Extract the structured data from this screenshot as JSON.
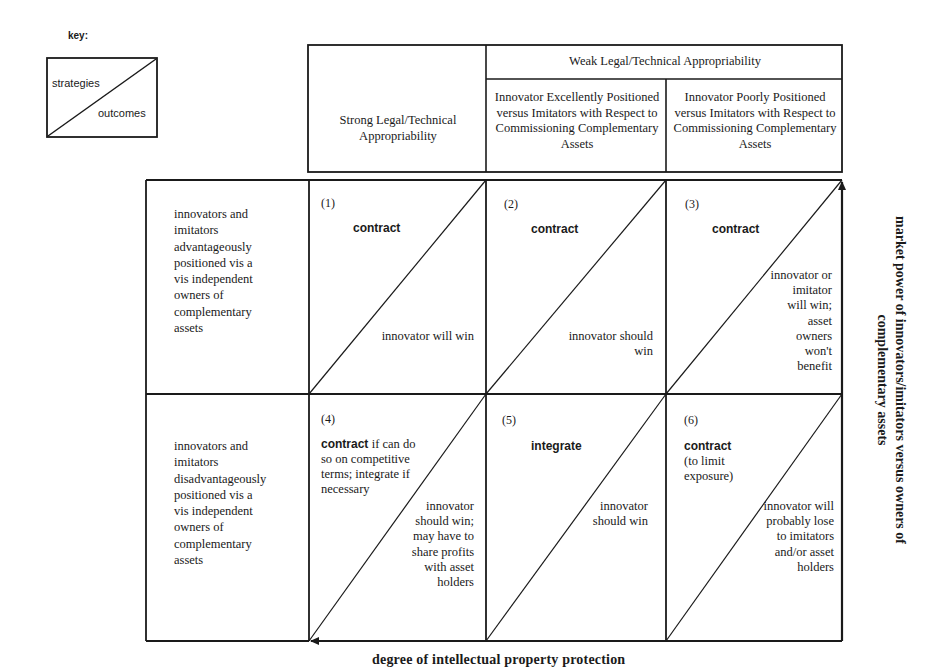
{
  "key": {
    "title": "key:",
    "upper": "strategies",
    "lower": "outcomes"
  },
  "columns": {
    "strong": "Strong Legal/Technical Appropriability",
    "weak": "Weak Legal/Technical Appropriability",
    "weak_excellent": "Innovator Excellently Positioned versus Imitators with Respect to Commissioning Complementary Assets",
    "weak_poor": "Innovator Poorly Positioned versus Imitators with Respect to Commissioning Complementary Assets"
  },
  "rows": {
    "advantaged": "innovators and imitators advantageously positioned vis a vis independent owners of complementary assets",
    "disadvantaged": "innovators and imitators disadvantageously positioned vis a vis independent owners of complementary assets"
  },
  "cells": [
    {
      "number": "(1)",
      "strategy": "contract",
      "strategy_rest": "",
      "outcome": "innovator will win"
    },
    {
      "number": "(2)",
      "strategy": "contract",
      "strategy_rest": "",
      "outcome": "innovator should win"
    },
    {
      "number": "(3)",
      "strategy": "contract",
      "strategy_rest": "",
      "outcome": "innovator or imitator will win; asset owners won't benefit"
    },
    {
      "number": "(4)",
      "strategy": "contract",
      "strategy_rest": "if can do so on competitive terms; integrate if necessary",
      "outcome": "innovator should win; may have to share profits with asset holders"
    },
    {
      "number": "(5)",
      "strategy": "integrate",
      "strategy_rest": "",
      "outcome": "innovator should win"
    },
    {
      "number": "(6)",
      "strategy": "contract",
      "strategy_rest": "(to limit exposure)",
      "outcome": "innovator will probably lose to imitators and/or asset holders"
    }
  ],
  "axes": {
    "x_label": "degree of intellectual property protection",
    "y_label": "market power of innovators/imitators versus owners of complementary assets"
  },
  "colors": {
    "ink": "#1a1a1a",
    "background": "#ffffff"
  }
}
